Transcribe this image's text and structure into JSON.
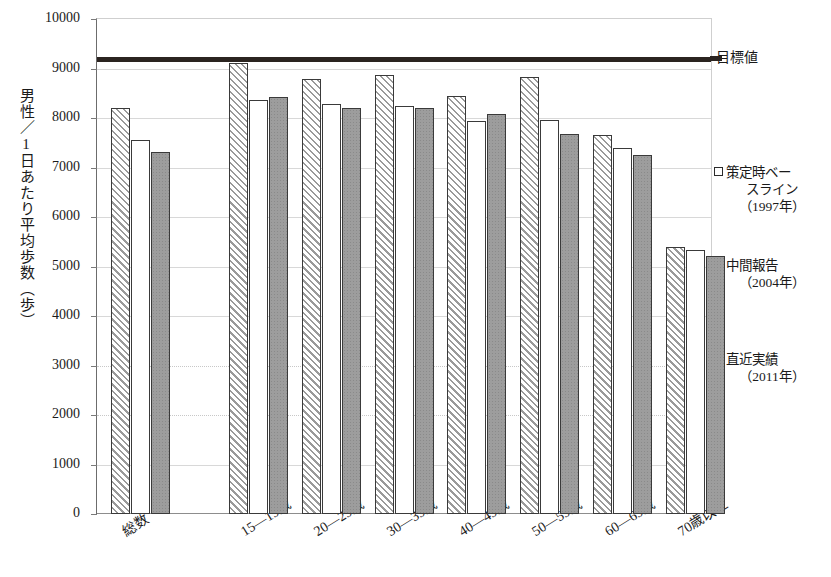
{
  "chart_data": {
    "type": "bar",
    "title": "",
    "xlabel": "",
    "ylabel": "男性／1日あたり平均歩数（歩）",
    "ylim": [
      0,
      10000
    ],
    "ytick_step": 1000,
    "yticks": [
      "10000",
      "9000",
      "8000",
      "7000",
      "6000",
      "5000",
      "4000",
      "3000",
      "2000",
      "1000",
      "0"
    ],
    "grid": true,
    "legend_position": "right",
    "categories": [
      "総数",
      "15—19歳",
      "20—29歳",
      "30—39歳",
      "40—49歳",
      "50—59歳",
      "60—69歳",
      "70歳以上"
    ],
    "series": [
      {
        "name": "策定時ベースライン（1997年）",
        "pattern": "diagonal-hatch",
        "values": [
          8200,
          9120,
          8790,
          8860,
          8440,
          8830,
          7660,
          5400
        ]
      },
      {
        "name": "中間報告（2004年）",
        "pattern": "white-dotted",
        "values": [
          7560,
          8360,
          8290,
          8250,
          7930,
          7970,
          7390,
          5340
        ]
      },
      {
        "name": "直近実績（2011年）",
        "pattern": "solid-gray",
        "values": [
          7310,
          8420,
          8210,
          8210,
          8080,
          7670,
          7260,
          5210
        ]
      }
    ],
    "reference_line": {
      "label": "目標値",
      "value": 9200,
      "color": "#2b2420",
      "style": "thick-solid"
    }
  },
  "axis": {
    "y_title": "男性／1日あたり平均歩数（歩）",
    "y_ticks": [
      "10000",
      "9000",
      "8000",
      "7000",
      "6000",
      "5000",
      "4000",
      "3000",
      "2000",
      "1000",
      "0"
    ],
    "x_ticks": [
      "総数",
      "15—19歳",
      "20—29歳",
      "30—39歳",
      "40—49歳",
      "50—59歳",
      "60—69歳",
      "70歳以上"
    ]
  },
  "legend": {
    "target_label": "目標値",
    "entries": [
      {
        "line1": "策定時ベー",
        "line2": "スライン",
        "year": "（1997年）",
        "swatch": "open-square"
      },
      {
        "line1": "中間報告",
        "line2": "",
        "year": "（2004年）",
        "swatch": "open-square"
      },
      {
        "line1": "直近実績",
        "line2": "",
        "year": "（2011年）",
        "swatch": "filled-square"
      }
    ]
  },
  "colors": {
    "target_line": "#2b2420",
    "bar_outline": "#3a3a3a",
    "series3_fill": "#9d9d9d",
    "gridline": "#d8d8d8",
    "axis": "#6c6c6c",
    "text": "#1a1a1a",
    "background": "#ffffff"
  }
}
